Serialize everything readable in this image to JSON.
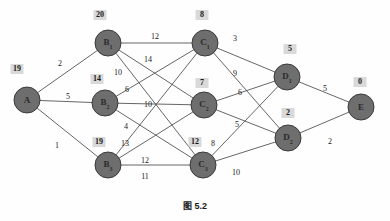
{
  "figure": {
    "caption": "图 5.2",
    "caption_symbol": "图",
    "caption_number": "5.2",
    "background_color": "#fefefe",
    "node_fill_color": "#6e6e6e",
    "node_stroke_color": "#3a3a3a",
    "edge_color": "#555555",
    "label_box_color": "#d9d9d9",
    "text_color": "#1a1a1a"
  },
  "nodes": [
    {
      "id": "A",
      "label": "A",
      "sub": "",
      "dist": "19",
      "cx": 27,
      "cy": 100,
      "r": 13,
      "box_x": 17,
      "box_y": 69
    },
    {
      "id": "B1",
      "label": "B",
      "sub": "1",
      "dist": "20",
      "cx": 108,
      "cy": 43,
      "r": 13,
      "box_x": 100,
      "box_y": 15
    },
    {
      "id": "B2",
      "label": "B",
      "sub": "2",
      "dist": "14",
      "cx": 105,
      "cy": 103,
      "r": 13,
      "box_x": 97,
      "box_y": 79
    },
    {
      "id": "B3",
      "label": "B",
      "sub": "3",
      "dist": "19",
      "cx": 108,
      "cy": 165,
      "r": 13,
      "box_x": 99,
      "box_y": 142
    },
    {
      "id": "C1",
      "label": "C",
      "sub": "1",
      "dist": "8",
      "cx": 205,
      "cy": 43,
      "r": 13,
      "box_x": 202,
      "box_y": 15
    },
    {
      "id": "C2",
      "label": "C",
      "sub": "2",
      "dist": "7",
      "cx": 204,
      "cy": 105,
      "r": 13,
      "box_x": 202,
      "box_y": 83
    },
    {
      "id": "C3",
      "label": "C",
      "sub": "3",
      "dist": "12",
      "cx": 203,
      "cy": 165,
      "r": 13,
      "box_x": 195,
      "box_y": 142
    },
    {
      "id": "D1",
      "label": "D",
      "sub": "1",
      "dist": "5",
      "cx": 287,
      "cy": 77,
      "r": 13,
      "box_x": 290,
      "box_y": 49
    },
    {
      "id": "D2",
      "label": "D",
      "sub": "2",
      "dist": "2",
      "cx": 288,
      "cy": 138,
      "r": 13,
      "box_x": 288,
      "box_y": 113
    },
    {
      "id": "E",
      "label": "E",
      "sub": "",
      "dist": "0",
      "cx": 361,
      "cy": 107,
      "r": 13,
      "box_x": 360,
      "box_y": 82
    }
  ],
  "edges": [
    {
      "from": "A",
      "to": "B1",
      "weight": "2",
      "lx": 60,
      "ly": 63
    },
    {
      "from": "A",
      "to": "B2",
      "weight": "5",
      "lx": 68,
      "ly": 96
    },
    {
      "from": "A",
      "to": "B3",
      "weight": "1",
      "lx": 57,
      "ly": 145
    },
    {
      "from": "B1",
      "to": "C1",
      "weight": "12",
      "lx": 155,
      "ly": 36
    },
    {
      "from": "B1",
      "to": "C2",
      "weight": "14",
      "lx": 148,
      "ly": 59
    },
    {
      "from": "B1",
      "to": "C3",
      "weight": "10",
      "lx": 118,
      "ly": 72
    },
    {
      "from": "B2",
      "to": "C1",
      "weight": "6",
      "lx": 127,
      "ly": 89
    },
    {
      "from": "B2",
      "to": "C2",
      "weight": "10",
      "lx": 148,
      "ly": 104
    },
    {
      "from": "B2",
      "to": "C3",
      "weight": "4",
      "lx": 126,
      "ly": 126
    },
    {
      "from": "B3",
      "to": "C1",
      "weight": "13",
      "lx": 125,
      "ly": 143
    },
    {
      "from": "B3",
      "to": "C2",
      "weight": "12",
      "lx": 145,
      "ly": 160
    },
    {
      "from": "B3",
      "to": "C3",
      "weight": "11",
      "lx": 145,
      "ly": 176
    },
    {
      "from": "C1",
      "to": "D1",
      "weight": "3",
      "lx": 235,
      "ly": 38
    },
    {
      "from": "C1",
      "to": "D2",
      "weight": "9",
      "lx": 235,
      "ly": 73
    },
    {
      "from": "C2",
      "to": "D1",
      "weight": "6",
      "lx": 240,
      "ly": 92
    },
    {
      "from": "C2",
      "to": "D2",
      "weight": "5",
      "lx": 237,
      "ly": 124
    },
    {
      "from": "C3",
      "to": "D1",
      "weight": "8",
      "lx": 213,
      "ly": 143
    },
    {
      "from": "C3",
      "to": "D2",
      "weight": "10",
      "lx": 236,
      "ly": 172
    },
    {
      "from": "D1",
      "to": "E",
      "weight": "5",
      "lx": 325,
      "ly": 88
    },
    {
      "from": "D2",
      "to": "E",
      "weight": "2",
      "lx": 330,
      "ly": 141
    }
  ]
}
